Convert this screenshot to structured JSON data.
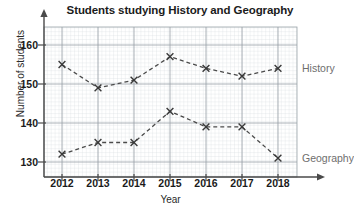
{
  "chart_data": {
    "type": "line",
    "title": "Students studying History and Geography",
    "xlabel": "Year",
    "ylabel": "Number of students",
    "categories": [
      "2012",
      "2013",
      "2014",
      "2015",
      "2016",
      "2017",
      "2018"
    ],
    "x": [
      2012,
      2013,
      2014,
      2015,
      2016,
      2017,
      2018
    ],
    "xlim": [
      2011.5,
      2018.6
    ],
    "ylim": [
      126,
      163
    ],
    "yticks": [
      130,
      140,
      150,
      160
    ],
    "ytick_labels": [
      "130",
      "140",
      "150",
      "160"
    ],
    "grid": true,
    "minor_grid": true,
    "legend_position": "right-inline",
    "marker": "x",
    "linestyle": "dashed",
    "series": [
      {
        "name": "History",
        "color": "#4a4a4a",
        "values": [
          155,
          149,
          151,
          157,
          154,
          152,
          154
        ]
      },
      {
        "name": "Geography",
        "color": "#4a4a4a",
        "values": [
          132,
          135,
          135,
          143,
          139,
          139,
          131
        ]
      }
    ]
  },
  "axis": {
    "y_title": "Number of students",
    "x_title": "Year",
    "y_tick_labels": [
      "160",
      "150",
      "140",
      "130"
    ],
    "x_tick_labels": [
      "2012",
      "2013",
      "2014",
      "2015",
      "2016",
      "2017",
      "2018"
    ]
  },
  "legend": {
    "history_label": "History",
    "geography_label": "Geography"
  },
  "header": {
    "title": "Students studying History and Geography"
  },
  "artifacts": {
    "cropped_top_text": ""
  }
}
